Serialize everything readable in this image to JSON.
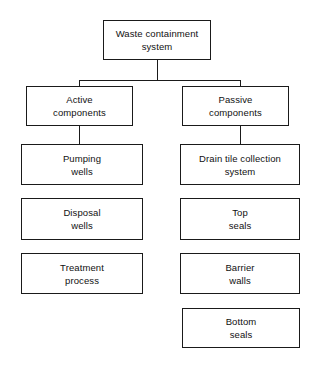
{
  "diagram": {
    "type": "tree-org-chart",
    "canvas": {
      "width": 323,
      "height": 366
    },
    "colors": {
      "background": "#ffffff",
      "box_border": "#1a1a1a",
      "box_fill": "#ffffff",
      "connector": "#1a1a1a",
      "text": "#111111"
    },
    "nodes": {
      "root": {
        "label": "Waste containment system",
        "line1": "Waste containment",
        "line2": "system"
      },
      "active": {
        "label": "Active components",
        "line1": "Active",
        "line2": "components"
      },
      "passive": {
        "label": "Passive components",
        "line1": "Passive",
        "line2": "components"
      },
      "pumping_wells": {
        "label": "Pumping wells",
        "line1": "Pumping",
        "line2": "wells"
      },
      "drain_tile": {
        "label": "Drain tile collection system",
        "line1": "Drain tile collection",
        "line2": "system"
      },
      "disposal_wells": {
        "label": "Disposal wells",
        "line1": "Disposal",
        "line2": "wells"
      },
      "top_seals": {
        "label": "Top seals",
        "line1": "Top",
        "line2": "seals"
      },
      "treatment_process": {
        "label": "Treatment process",
        "line1": "Treatment",
        "line2": "process"
      },
      "barrier_walls": {
        "label": "Barrier walls",
        "line1": "Barrier",
        "line2": "walls"
      },
      "bottom_seals": {
        "label": "Bottom seals",
        "line1": "Bottom",
        "line2": "seals"
      }
    }
  }
}
